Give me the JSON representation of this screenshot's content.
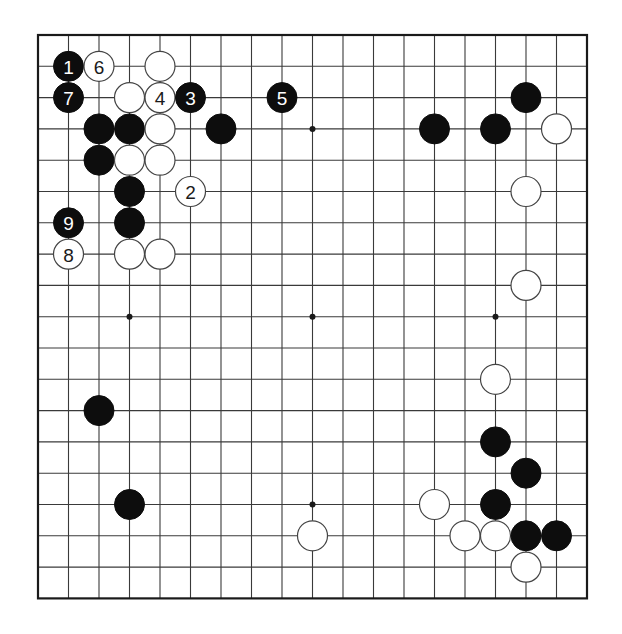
{
  "board": {
    "size": 19,
    "origin_x": 38,
    "origin_y": 35,
    "spacing_x": 30.5,
    "spacing_y": 31.3,
    "stone_radius": 15,
    "colors": {
      "line": "#3a3a3a",
      "border": "#1a1a1a",
      "black_stone": "#0d0d0d",
      "white_stone": "#ffffff",
      "white_stone_outline": "#444444"
    }
  },
  "star_points": [
    {
      "c": 3,
      "r": 3
    },
    {
      "c": 9,
      "r": 3
    },
    {
      "c": 15,
      "r": 3
    },
    {
      "c": 3,
      "r": 9
    },
    {
      "c": 9,
      "r": 9
    },
    {
      "c": 15,
      "r": 9
    },
    {
      "c": 3,
      "r": 15
    },
    {
      "c": 9,
      "r": 15
    },
    {
      "c": 15,
      "r": 15
    }
  ],
  "stones": [
    {
      "c": 1,
      "r": 1,
      "color": "black",
      "label": "1"
    },
    {
      "c": 2,
      "r": 1,
      "color": "white",
      "label": "6"
    },
    {
      "c": 4,
      "r": 1,
      "color": "white",
      "label": ""
    },
    {
      "c": 1,
      "r": 2,
      "color": "black",
      "label": "7"
    },
    {
      "c": 3,
      "r": 2,
      "color": "white",
      "label": ""
    },
    {
      "c": 4,
      "r": 2,
      "color": "white",
      "label": "4"
    },
    {
      "c": 5,
      "r": 2,
      "color": "black",
      "label": "3"
    },
    {
      "c": 8,
      "r": 2,
      "color": "black",
      "label": "5"
    },
    {
      "c": 2,
      "r": 3,
      "color": "black",
      "label": ""
    },
    {
      "c": 3,
      "r": 3,
      "color": "black",
      "label": ""
    },
    {
      "c": 4,
      "r": 3,
      "color": "white",
      "label": ""
    },
    {
      "c": 6,
      "r": 3,
      "color": "black",
      "label": ""
    },
    {
      "c": 2,
      "r": 4,
      "color": "black",
      "label": ""
    },
    {
      "c": 3,
      "r": 4,
      "color": "white",
      "label": ""
    },
    {
      "c": 4,
      "r": 4,
      "color": "white",
      "label": ""
    },
    {
      "c": 3,
      "r": 5,
      "color": "black",
      "label": ""
    },
    {
      "c": 5,
      "r": 5,
      "color": "white",
      "label": "2"
    },
    {
      "c": 1,
      "r": 6,
      "color": "black",
      "label": "9"
    },
    {
      "c": 3,
      "r": 6,
      "color": "black",
      "label": ""
    },
    {
      "c": 1,
      "r": 7,
      "color": "white",
      "label": "8"
    },
    {
      "c": 3,
      "r": 7,
      "color": "white",
      "label": ""
    },
    {
      "c": 4,
      "r": 7,
      "color": "white",
      "label": ""
    },
    {
      "c": 16,
      "r": 2,
      "color": "black",
      "label": ""
    },
    {
      "c": 13,
      "r": 3,
      "color": "black",
      "label": ""
    },
    {
      "c": 15,
      "r": 3,
      "color": "black",
      "label": ""
    },
    {
      "c": 17,
      "r": 3,
      "color": "white",
      "label": ""
    },
    {
      "c": 16,
      "r": 5,
      "color": "white",
      "label": ""
    },
    {
      "c": 16,
      "r": 8,
      "color": "white",
      "label": ""
    },
    {
      "c": 15,
      "r": 11,
      "color": "white",
      "label": ""
    },
    {
      "c": 2,
      "r": 12,
      "color": "black",
      "label": ""
    },
    {
      "c": 15,
      "r": 13,
      "color": "black",
      "label": ""
    },
    {
      "c": 16,
      "r": 14,
      "color": "black",
      "label": ""
    },
    {
      "c": 3,
      "r": 15,
      "color": "black",
      "label": ""
    },
    {
      "c": 13,
      "r": 15,
      "color": "white",
      "label": ""
    },
    {
      "c": 15,
      "r": 15,
      "color": "black",
      "label": ""
    },
    {
      "c": 9,
      "r": 16,
      "color": "white",
      "label": ""
    },
    {
      "c": 14,
      "r": 16,
      "color": "white",
      "label": ""
    },
    {
      "c": 15,
      "r": 16,
      "color": "white",
      "label": ""
    },
    {
      "c": 16,
      "r": 16,
      "color": "black",
      "label": ""
    },
    {
      "c": 17,
      "r": 16,
      "color": "black",
      "label": ""
    },
    {
      "c": 16,
      "r": 17,
      "color": "white",
      "label": ""
    }
  ]
}
